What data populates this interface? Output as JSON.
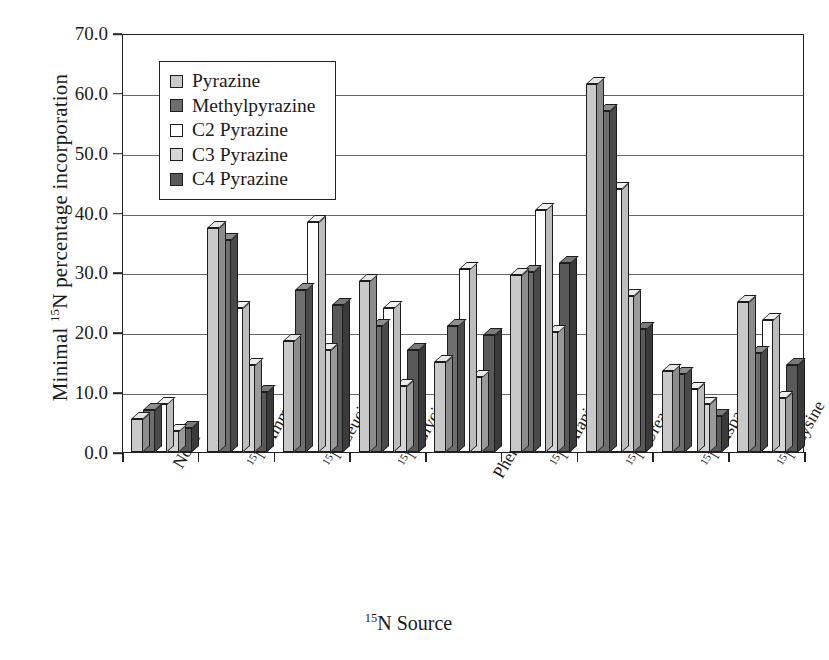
{
  "chart_data": {
    "type": "bar",
    "title": "",
    "xlabel": "15N Source",
    "xlabel_html": "<sup>15</sup>N Source",
    "ylabel": "Minimal 15N percentage incorporation",
    "ylabel_html": "Minimal <sup>15</sup>N percentage incorporation",
    "ylim": [
      0,
      70
    ],
    "ytick_values": [
      0,
      10,
      20,
      30,
      40,
      50,
      60,
      70
    ],
    "ytick_labels": [
      "0.0",
      "10.0",
      "20.0",
      "30.0",
      "40.0",
      "50.0",
      "60.0",
      "70.0"
    ],
    "grid": "horizontal",
    "legend_position": "top-left",
    "categories": [
      "None",
      "15N Ammonium acetate",
      "15N Leucine",
      "15N Glycine",
      "15N Phenylalanine",
      "15N Alanine",
      "15N Urea",
      "15N Asparagine",
      "15N Lysine"
    ],
    "category_lines": [
      [
        "None"
      ],
      [
        "15N Ammonium",
        "acetate"
      ],
      [
        "15N Leucine"
      ],
      [
        "15N Glycine"
      ],
      [
        "15N",
        "Phenylalanine"
      ],
      [
        "15N Alanine"
      ],
      [
        "15N Urea"
      ],
      [
        "15N Asparagine"
      ],
      [
        "15N Lysine"
      ]
    ],
    "series": [
      {
        "name": "Pyrazine",
        "color": "#c9c9c9",
        "side_color": "#8c8c8c",
        "top_color": "#e6e6e6",
        "values": [
          5.5,
          37.5,
          18.5,
          28.5,
          15.0,
          29.5,
          61.5,
          13.5,
          25.0
        ]
      },
      {
        "name": "Methylpyrazine",
        "color": "#6e6e6e",
        "side_color": "#4a4a4a",
        "top_color": "#8f8f8f",
        "values": [
          7.0,
          35.5,
          27.0,
          21.0,
          21.0,
          30.0,
          57.0,
          13.0,
          16.5
        ]
      },
      {
        "name": "C2 Pyrazine",
        "color": "#ffffff",
        "side_color": "#bdbdbd",
        "top_color": "#f2f2f2",
        "values": [
          8.0,
          24.0,
          38.5,
          24.0,
          30.5,
          40.5,
          44.0,
          10.5,
          22.0
        ]
      },
      {
        "name": "C3 Pyrazine",
        "color": "#d5d5d5",
        "side_color": "#9a9a9a",
        "top_color": "#ededed",
        "values": [
          3.5,
          14.5,
          17.0,
          11.0,
          12.5,
          20.0,
          26.0,
          8.0,
          9.0
        ]
      },
      {
        "name": "C4 Pyrazine",
        "color": "#595959",
        "side_color": "#3a3a3a",
        "top_color": "#7a7a7a",
        "values": [
          4.0,
          10.0,
          24.5,
          17.0,
          19.5,
          31.5,
          20.5,
          6.0,
          14.5
        ]
      }
    ]
  }
}
